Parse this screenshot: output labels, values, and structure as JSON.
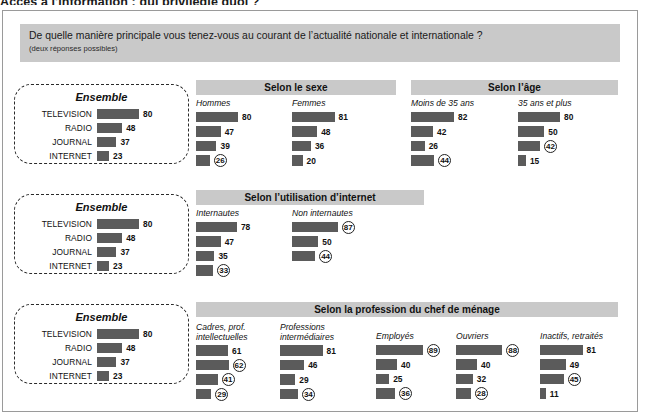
{
  "headline": "Accès à l'information : qui privilégie quoi ?",
  "question": {
    "text": "De quelle manière principale vous tenez-vous au courant de l’actualité nationale et internationale ?",
    "sub": "(deux réponses possibles)"
  },
  "ensemble": {
    "title": "Ensemble",
    "labels": [
      "TELEVISION",
      "RADIO",
      "JOURNAL",
      "INTERNET"
    ],
    "values": [
      80,
      48,
      37,
      23
    ]
  },
  "sections": [
    {
      "title": "Selon le sexe",
      "groups": [
        {
          "title": "Hommes",
          "values": [
            80,
            47,
            39,
            26
          ],
          "circled": [
            false,
            false,
            false,
            true
          ]
        },
        {
          "title": "Femmes",
          "values": [
            81,
            48,
            36,
            20
          ],
          "circled": [
            false,
            false,
            false,
            false
          ]
        }
      ]
    },
    {
      "title": "Selon l’âge",
      "groups": [
        {
          "title": "Moins de 35 ans",
          "values": [
            82,
            42,
            26,
            44
          ],
          "circled": [
            false,
            false,
            false,
            true
          ]
        },
        {
          "title": "35 ans et plus",
          "values": [
            80,
            50,
            42,
            15
          ],
          "circled": [
            false,
            false,
            true,
            false
          ]
        }
      ]
    },
    {
      "title": "Selon l’utilisation d’internet",
      "groups": [
        {
          "title": "Internautes",
          "values": [
            78,
            47,
            35,
            33
          ],
          "circled": [
            false,
            false,
            false,
            true
          ]
        },
        {
          "title": "Non internautes",
          "values": [
            87,
            50,
            44
          ],
          "circled": [
            true,
            false,
            true
          ]
        }
      ]
    },
    {
      "title": "Selon la profession du chef de ménage",
      "groups": [
        {
          "title": "Cadres, prof.\nintellectuelles",
          "values": [
            61,
            62,
            41,
            29
          ],
          "circled": [
            false,
            true,
            true,
            true
          ]
        },
        {
          "title": "Professions\nintermédiaires",
          "values": [
            81,
            46,
            29,
            34
          ],
          "circled": [
            false,
            false,
            false,
            true
          ]
        },
        {
          "title": "Employés",
          "values": [
            89,
            40,
            25,
            36
          ],
          "circled": [
            true,
            false,
            false,
            true
          ]
        },
        {
          "title": "Ouvriers",
          "values": [
            88,
            40,
            32,
            28
          ],
          "circled": [
            true,
            false,
            false,
            true
          ]
        },
        {
          "title": "Inactifs, retraités",
          "values": [
            81,
            49,
            45,
            11
          ],
          "circled": [
            false,
            false,
            true,
            false
          ]
        }
      ]
    }
  ],
  "colors": {
    "bar": "#5b5b5b",
    "banner": "#c9c9c9",
    "frame": "#9a9a9a"
  },
  "layout": {
    "bar_scale": 0.525
  }
}
